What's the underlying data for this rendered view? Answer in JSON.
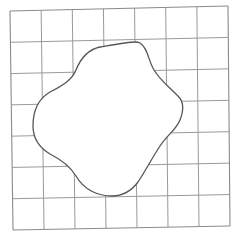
{
  "diagram": {
    "type": "grid-with-closed-curve",
    "grid": {
      "rows": 7,
      "cols": 7,
      "corners": {
        "top_left": [
          10,
          11
        ],
        "top_right": [
          228,
          6
        ],
        "bottom_right": [
          230,
          226
        ],
        "bottom_left": [
          13,
          230
        ]
      },
      "line_color": "#9a9a9a"
    },
    "shape": {
      "name": "irregular-blob",
      "stroke_color": "#555555",
      "fill_color": "#ffffff",
      "path": "M 135 42 C 128 42, 112 45, 100 47 C 86 50, 80 60, 76 70 C 72 80, 62 86, 50 92 C 38 99, 33 112, 33 126 C 33 140, 40 148, 50 154 C 62 160, 70 166, 76 176 C 84 190, 98 196, 112 196 C 124 196, 132 190, 138 182 C 146 170, 152 158, 160 146 C 168 134, 176 130, 180 120 C 184 110, 184 102, 178 96 C 168 86, 160 80, 154 70 C 148 60, 148 48, 140 43 C 138 42, 136 42, 135 42 Z"
    }
  }
}
